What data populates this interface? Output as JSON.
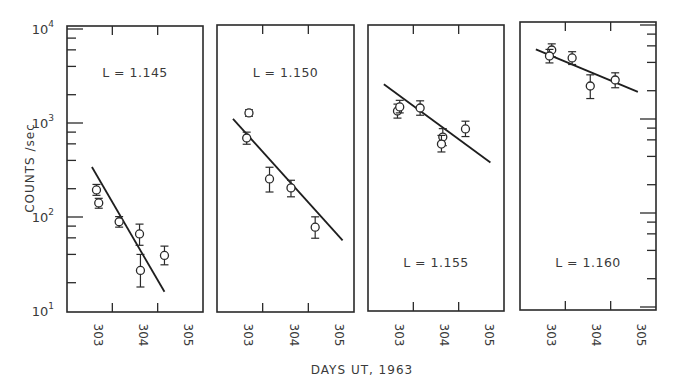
{
  "chart_data": {
    "type": "scatter",
    "title": "",
    "xlabel": "DAYS UT, 1963",
    "ylabel": "COUNTS /sec",
    "yscale": "log",
    "ylim": [
      10,
      10000
    ],
    "y_tick_labels": [
      {
        "base": "10",
        "exp": "4",
        "value": 10000
      },
      {
        "base": "10",
        "exp": "3",
        "value": 1000
      },
      {
        "base": "10",
        "exp": "2",
        "value": 100
      },
      {
        "base": "10",
        "exp": "1",
        "value": 10
      }
    ],
    "x_tick_labels": [
      "303",
      "304",
      "305"
    ],
    "xlim": [
      302.5,
      305.5
    ],
    "grid": false,
    "legend": "none",
    "panels": [
      {
        "label": "L = 1.145",
        "label_pos": "top",
        "points": [
          {
            "x": 303.15,
            "y": 194,
            "err_lo": 170,
            "err_hi": 222
          },
          {
            "x": 303.2,
            "y": 141,
            "err_lo": 124,
            "err_hi": 158
          },
          {
            "x": 303.65,
            "y": 89,
            "err_lo": 78,
            "err_hi": 101
          },
          {
            "x": 304.1,
            "y": 66,
            "err_lo": 50,
            "err_hi": 84
          },
          {
            "x": 304.12,
            "y": 27,
            "err_lo": 18,
            "err_hi": 40
          },
          {
            "x": 304.65,
            "y": 39,
            "err_lo": 31,
            "err_hi": 49
          }
        ],
        "fit": {
          "x1": 303.05,
          "y1": 340,
          "x2": 304.65,
          "y2": 16
        }
      },
      {
        "label": "L = 1.150",
        "label_pos": "top",
        "points": [
          {
            "x": 303.2,
            "y": 1248,
            "err_lo": 1150,
            "err_hi": 1350
          },
          {
            "x": 303.15,
            "y": 676,
            "err_lo": 580,
            "err_hi": 780
          },
          {
            "x": 303.65,
            "y": 248,
            "err_lo": 180,
            "err_hi": 330
          },
          {
            "x": 304.12,
            "y": 199,
            "err_lo": 160,
            "err_hi": 240
          },
          {
            "x": 304.65,
            "y": 76,
            "err_lo": 58,
            "err_hi": 98
          }
        ],
        "fit": {
          "x1": 302.85,
          "y1": 1080,
          "x2": 305.25,
          "y2": 55
        }
      },
      {
        "label": "L = 1.155",
        "label_pos": "bottom",
        "points": [
          {
            "x": 303.15,
            "y": 1309,
            "err_lo": 1100,
            "err_hi": 1550
          },
          {
            "x": 303.2,
            "y": 1445,
            "err_lo": 1250,
            "err_hi": 1700
          },
          {
            "x": 303.65,
            "y": 1409,
            "err_lo": 1180,
            "err_hi": 1680
          },
          {
            "x": 304.15,
            "y": 692,
            "err_lo": 560,
            "err_hi": 850
          },
          {
            "x": 304.12,
            "y": 583,
            "err_lo": 480,
            "err_hi": 720
          },
          {
            "x": 304.65,
            "y": 843,
            "err_lo": 700,
            "err_hi": 1020
          }
        ],
        "fit": {
          "x1": 302.85,
          "y1": 2520,
          "x2": 305.2,
          "y2": 370
        }
      },
      {
        "label": "L = 1.160",
        "label_pos": "bottom",
        "points": [
          {
            "x": 303.2,
            "y": 5420,
            "err_lo": 4600,
            "err_hi": 6300
          },
          {
            "x": 303.15,
            "y": 4680,
            "err_lo": 3950,
            "err_hi": 5500
          },
          {
            "x": 303.65,
            "y": 4460,
            "err_lo": 3800,
            "err_hi": 5200
          },
          {
            "x": 304.05,
            "y": 2245,
            "err_lo": 1650,
            "err_hi": 2950
          },
          {
            "x": 304.6,
            "y": 2600,
            "err_lo": 2150,
            "err_hi": 3100
          }
        ],
        "fit": {
          "x1": 302.85,
          "y1": 5500,
          "x2": 305.1,
          "y2": 1940
        }
      }
    ]
  }
}
